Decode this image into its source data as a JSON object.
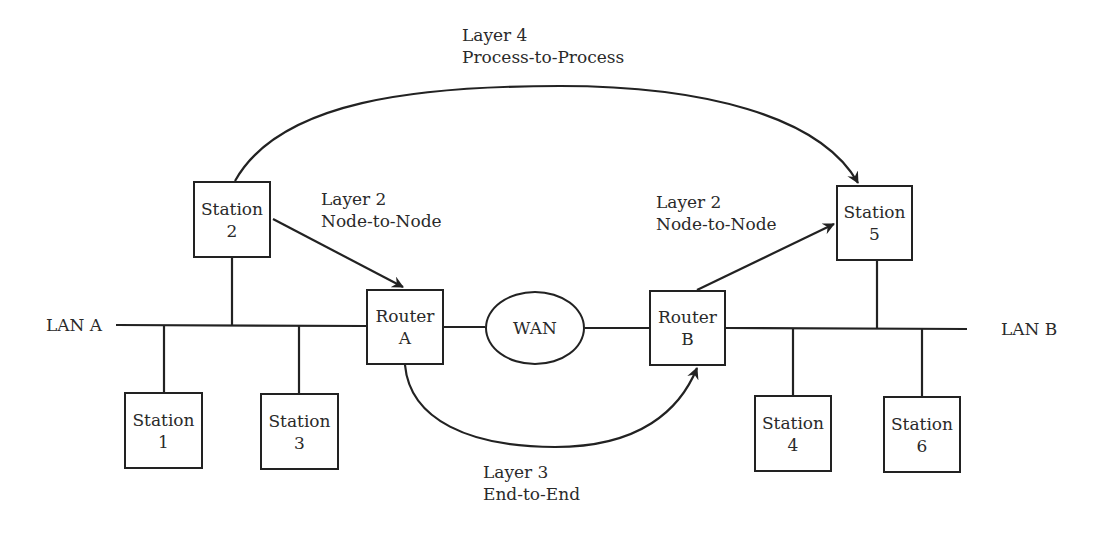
{
  "diagram": {
    "networks": {
      "lan_a": "LAN A",
      "lan_b": "LAN B",
      "wan": "WAN"
    },
    "nodes": {
      "station1": {
        "line1": "Station",
        "line2": "1"
      },
      "station2": {
        "line1": "Station",
        "line2": "2"
      },
      "station3": {
        "line1": "Station",
        "line2": "3"
      },
      "station4": {
        "line1": "Station",
        "line2": "4"
      },
      "station5": {
        "line1": "Station",
        "line2": "5"
      },
      "station6": {
        "line1": "Station",
        "line2": "6"
      },
      "routerA": {
        "line1": "Router",
        "line2": "A"
      },
      "routerB": {
        "line1": "Router",
        "line2": "B"
      }
    },
    "annotations": {
      "layer4": {
        "line1": "Layer 4",
        "line2": "Process-to-Process"
      },
      "layer2_left": {
        "line1": "Layer 2",
        "line2": "Node-to-Node"
      },
      "layer2_right": {
        "line1": "Layer 2",
        "line2": "Node-to-Node"
      },
      "layer3": {
        "line1": "Layer 3",
        "line2": "End-to-End"
      }
    },
    "colors": {
      "line": "#222222",
      "text": "#2a2a2a",
      "background": "#ffffff"
    }
  }
}
